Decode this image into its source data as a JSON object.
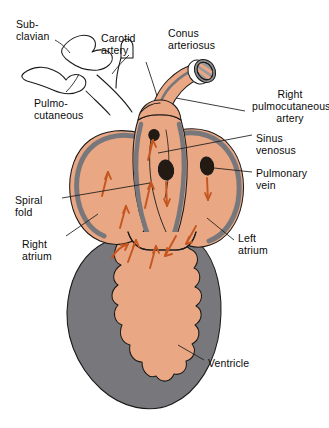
{
  "figure": {
    "type": "anatomical-diagram",
    "background": "#ffffff"
  },
  "palette": {
    "chamber_fill": "#eaa784",
    "chamber_fill_light": "#f0b894",
    "wall_gray": "#78787c",
    "outline": "#1a1a1a",
    "ostium_dark": "#231a14",
    "flow_arrow": "#c4561f",
    "vessel_white": "#ffffff",
    "text": "#0a0a0a"
  },
  "labels": [
    {
      "name": "subclavian",
      "lines": [
        "Sub-",
        "clavian"
      ],
      "x": 16,
      "y": 18,
      "align": "left"
    },
    {
      "name": "carotid-artery",
      "lines": [
        "Carotid",
        "artery"
      ],
      "x": 101,
      "y": 32,
      "align": "left"
    },
    {
      "name": "conus-arteriosus",
      "lines": [
        "Conus",
        "arteriosus"
      ],
      "x": 168,
      "y": 27,
      "align": "left"
    },
    {
      "name": "pulmocutaneous",
      "lines": [
        "Pulmo-",
        "cutaneous"
      ],
      "x": 34,
      "y": 97,
      "align": "left"
    },
    {
      "name": "right-pulmocutaneous-artery",
      "lines": [
        "Right",
        "pulmocutaneous",
        "artery"
      ],
      "x": 252,
      "y": 88,
      "align": "center"
    },
    {
      "name": "sinus-venosus",
      "lines": [
        "Sinus",
        "venosus"
      ],
      "x": 256,
      "y": 132,
      "align": "left"
    },
    {
      "name": "pulmonary-vein",
      "lines": [
        "Pulmonary",
        "vein"
      ],
      "x": 256,
      "y": 167,
      "align": "left"
    },
    {
      "name": "spiral-fold",
      "lines": [
        "Spiral",
        "fold"
      ],
      "x": 15,
      "y": 194,
      "align": "left"
    },
    {
      "name": "right-atrium",
      "lines": [
        "Right",
        "atrium"
      ],
      "x": 22,
      "y": 238,
      "align": "left"
    },
    {
      "name": "left-atrium",
      "lines": [
        "Left",
        "atrium"
      ],
      "x": 238,
      "y": 232,
      "align": "left"
    },
    {
      "name": "ventricle",
      "lines": [
        "Ventricle"
      ],
      "x": 208,
      "y": 357,
      "align": "left"
    }
  ],
  "structures": [
    {
      "name": "subclavian-vessel",
      "fill": "white"
    },
    {
      "name": "carotid-artery-vessel",
      "fill": "white"
    },
    {
      "name": "pulmocutaneous-vessel",
      "fill": "white"
    },
    {
      "name": "conus-arteriosus-trunk",
      "fill": "salmon"
    },
    {
      "name": "conus-cut-end",
      "fill": "white-gray-striped"
    },
    {
      "name": "right-atrium-chamber",
      "fill": "salmon"
    },
    {
      "name": "left-atrium-chamber",
      "fill": "salmon"
    },
    {
      "name": "ventricle-wall",
      "fill": "gray"
    },
    {
      "name": "ventricle-cavity",
      "fill": "salmon"
    },
    {
      "name": "spiral-fold-ridge",
      "fill": "salmon"
    },
    {
      "name": "sinus-venosus-ostium",
      "fill": "dark"
    },
    {
      "name": "pulmonary-vein-ostium",
      "fill": "dark"
    },
    {
      "name": "upper-ostium",
      "fill": "dark"
    }
  ],
  "flow_arrows": {
    "count": 11,
    "color": "#c4561f",
    "meaning": "blood flow direction"
  }
}
